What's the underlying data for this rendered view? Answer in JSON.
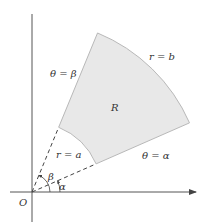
{
  "diagram": {
    "colors": {
      "region_fill": "#e8e8e8",
      "region_stroke": "#b8b8b8",
      "axis": "#555555",
      "dashed": "#444444",
      "text": "#333333"
    },
    "origin": {
      "x": 32,
      "y": 192
    },
    "angles_deg": {
      "alpha": 23.7,
      "beta": 67.6
    },
    "radii_px": {
      "a": 70,
      "b": 172
    },
    "labels": {
      "origin": "O",
      "region": "R",
      "theta_beta": "θ = β",
      "theta_alpha": "θ = α",
      "r_b": "r = b",
      "r_a": "r = a",
      "beta": "β",
      "alpha": "α"
    }
  }
}
